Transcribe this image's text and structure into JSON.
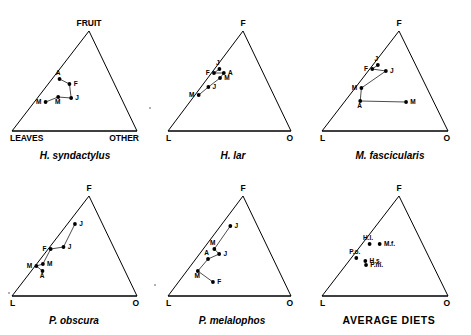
{
  "figure": {
    "background": "#ffffff",
    "ink": "#000000",
    "panel_count": 6
  },
  "chart_data": {
    "type": "scatter",
    "title": "",
    "subtitle": "",
    "axes": {
      "apex_top": "FRUIT",
      "apex_bottom_left": "LEAVES",
      "apex_bottom_right": "OTHER",
      "apex_top_short": "F",
      "apex_bottom_left_short": "L",
      "apex_bottom_right_short": "O"
    },
    "grid": false,
    "legend": "none",
    "month_codes": [
      "J",
      "F",
      "M",
      "A",
      "M",
      "J"
    ],
    "panels": [
      {
        "id": "h-syndactylus",
        "caption": "H. syndactylus",
        "vertex_labels": {
          "top": "FRUIT",
          "left": "LEAVES",
          "right": "OTHER"
        },
        "vertex_label_style": "long",
        "connected": true,
        "points": [
          {
            "label": "A",
            "fruit": 52,
            "leaves": 42,
            "other": 6,
            "label_pos": "above"
          },
          {
            "label": "F",
            "fruit": 47,
            "leaves": 36,
            "other": 17,
            "label_pos": "right"
          },
          {
            "label": "J",
            "fruit": 33,
            "leaves": 40,
            "other": 27,
            "label_pos": "right"
          },
          {
            "label": "M",
            "fruit": 34,
            "leaves": 50,
            "other": 16,
            "label_pos": "below"
          },
          {
            "label": "M",
            "fruit": 29,
            "leaves": 62,
            "other": 9,
            "label_pos": "left"
          }
        ]
      },
      {
        "id": "h-lar",
        "caption": "H. lar",
        "vertex_labels": {
          "top": "F",
          "left": "L",
          "right": "O"
        },
        "vertex_label_style": "short",
        "connected": true,
        "points": [
          {
            "label": "J",
            "fruit": 62,
            "leaves": 34,
            "other": 4,
            "label_pos": "above"
          },
          {
            "label": "F",
            "fruit": 58,
            "leaves": 40,
            "other": 2,
            "label_pos": "left"
          },
          {
            "label": "A",
            "fruit": 58,
            "leaves": 32,
            "other": 10,
            "label_pos": "right"
          },
          {
            "label": "M",
            "fruit": 53,
            "leaves": 37,
            "other": 10,
            "label_pos": "right"
          },
          {
            "label": "J",
            "fruit": 44,
            "leaves": 50,
            "other": 6,
            "label_pos": "right"
          },
          {
            "label": "M",
            "fruit": 36,
            "leaves": 61,
            "other": 3,
            "label_pos": "left"
          }
        ]
      },
      {
        "id": "m-fascicularis",
        "caption": "M. fascicularis",
        "vertex_labels": {
          "top": "F",
          "left": "L",
          "right": "O"
        },
        "vertex_label_style": "short",
        "connected": true,
        "points": [
          {
            "label": "J",
            "fruit": 66,
            "leaves": 30,
            "other": 4,
            "label_pos": "above"
          },
          {
            "label": "F",
            "fruit": 62,
            "leaves": 36,
            "other": 2,
            "label_pos": "left"
          },
          {
            "label": "J",
            "fruit": 60,
            "leaves": 26,
            "other": 14,
            "label_pos": "right"
          },
          {
            "label": "M",
            "fruit": 43,
            "leaves": 52,
            "other": 5,
            "label_pos": "left"
          },
          {
            "label": "A",
            "fruit": 30,
            "leaves": 58,
            "other": 12,
            "label_pos": "below"
          },
          {
            "label": "M",
            "fruit": 29,
            "leaves": 22,
            "other": 49,
            "label_pos": "right"
          }
        ]
      },
      {
        "id": "p-obscura",
        "caption": "P. obscura",
        "vertex_labels": {
          "top": "F",
          "left": "L",
          "right": "O"
        },
        "vertex_label_style": "short",
        "connected": true,
        "points": [
          {
            "label": "J",
            "fruit": 72,
            "leaves": 22,
            "other": 6,
            "label_pos": "right"
          },
          {
            "label": "J",
            "fruit": 49,
            "leaves": 40,
            "other": 11,
            "label_pos": "right"
          },
          {
            "label": "F",
            "fruit": 47,
            "leaves": 51,
            "other": 2,
            "label_pos": "left"
          },
          {
            "label": "M",
            "fruit": 32,
            "leaves": 63,
            "other": 5,
            "label_pos": "right"
          },
          {
            "label": "M",
            "fruit": 30,
            "leaves": 69,
            "other": 1,
            "label_pos": "left"
          },
          {
            "label": "A",
            "fruit": 25,
            "leaves": 66,
            "other": 9,
            "label_pos": "below"
          }
        ]
      },
      {
        "id": "p-melalophos",
        "caption": "P. melalophos",
        "vertex_labels": {
          "top": "F",
          "left": "L",
          "right": "O"
        },
        "vertex_label_style": "short",
        "connected": true,
        "points": [
          {
            "label": "J",
            "fruit": 70,
            "leaves": 22,
            "other": 8,
            "label_pos": "right"
          },
          {
            "label": "M",
            "fruit": 47,
            "leaves": 44,
            "other": 9,
            "label_pos": "above"
          },
          {
            "label": "J",
            "fruit": 42,
            "leaves": 42,
            "other": 16,
            "label_pos": "right"
          },
          {
            "label": "A",
            "fruit": 37,
            "leaves": 53,
            "other": 10,
            "label_pos": "above"
          },
          {
            "label": "M",
            "fruit": 25,
            "leaves": 66,
            "other": 9,
            "label_pos": "below"
          },
          {
            "label": "F",
            "fruit": 14,
            "leaves": 58,
            "other": 28,
            "label_pos": "right"
          }
        ]
      },
      {
        "id": "average-diets",
        "caption": "AVERAGE DIETS",
        "caption_style": "plain",
        "vertex_labels": {
          "top": "F",
          "left": "L",
          "right": "O"
        },
        "vertex_label_style": "short",
        "connected": false,
        "points": [
          {
            "label": "H.l.",
            "fruit": 52,
            "leaves": 42,
            "other": 6,
            "label_pos": "above"
          },
          {
            "label": "M.f.",
            "fruit": 52,
            "leaves": 34,
            "other": 14,
            "label_pos": "right"
          },
          {
            "label": "P.o.",
            "fruit": 38,
            "leaves": 58,
            "other": 4,
            "label_pos": "above"
          },
          {
            "label": "H.s.",
            "fruit": 35,
            "leaves": 52,
            "other": 13,
            "label_pos": "right"
          },
          {
            "label": "P.m.",
            "fruit": 31,
            "leaves": 53,
            "other": 16,
            "label_pos": "right"
          }
        ]
      }
    ],
    "specks": [
      {
        "x": 150,
        "y": 108
      },
      {
        "x": 155,
        "y": 285
      },
      {
        "x": 9,
        "y": 293
      }
    ]
  }
}
